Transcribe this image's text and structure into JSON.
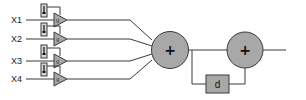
{
  "diagram": {
    "type": "signal-flow block diagram",
    "inputs": [
      {
        "label": "X1",
        "y": 20,
        "gain_label": "g"
      },
      {
        "label": "X2",
        "y": 39,
        "gain_label": "g"
      },
      {
        "label": "X3",
        "y": 61,
        "gain_label": "g"
      },
      {
        "label": "X4",
        "y": 79,
        "gain_label": "g"
      }
    ],
    "summer1": {
      "symbol": "+"
    },
    "summer2": {
      "symbol": "+"
    },
    "delay": {
      "label": "d"
    },
    "colors": {
      "fill": "#a8a8a8",
      "stroke": "#3a3a3a",
      "slider_fill": "#d8d8d8",
      "background": "#ffffff"
    }
  }
}
